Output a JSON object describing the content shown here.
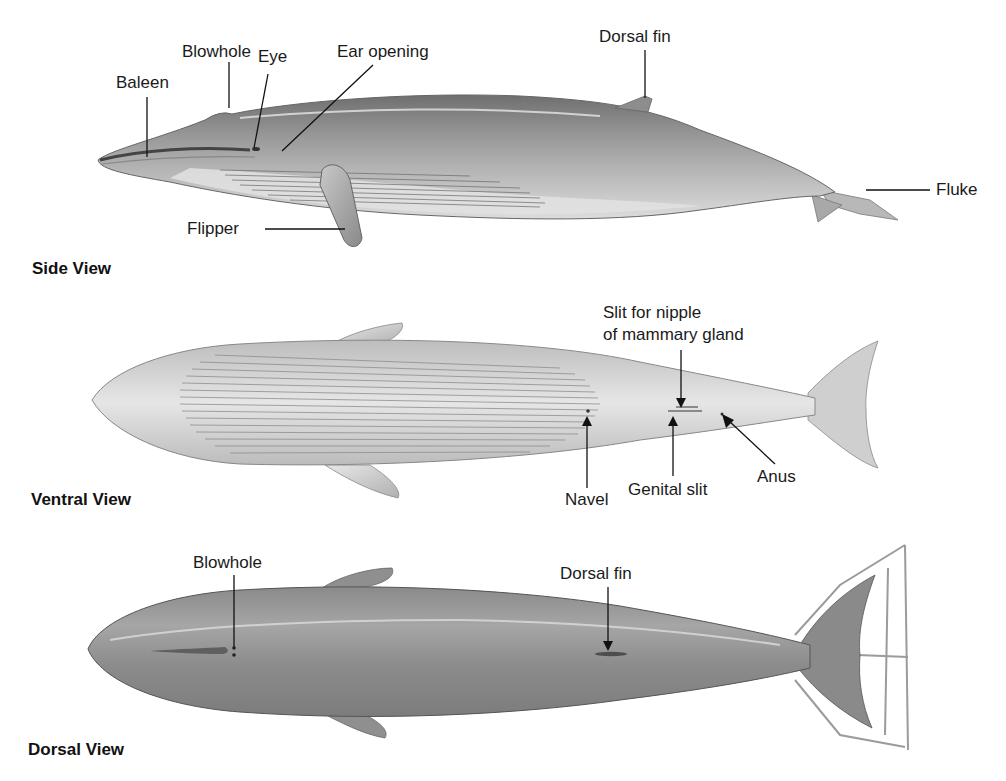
{
  "figure": {
    "views": [
      {
        "id": "side",
        "title": "Side View",
        "labels": {
          "baleen": "Baleen",
          "blowhole": "Blowhole",
          "eye": "Eye",
          "ear_opening": "Ear opening",
          "dorsal_fin": "Dorsal fin",
          "fluke": "Fluke",
          "flipper": "Flipper"
        }
      },
      {
        "id": "ventral",
        "title": "Ventral View",
        "labels": {
          "nipple_slit_line1": "Slit for nipple",
          "nipple_slit_line2": "of mammary gland",
          "navel": "Navel",
          "genital_slit": "Genital slit",
          "anus": "Anus"
        }
      },
      {
        "id": "dorsal",
        "title": "Dorsal View",
        "labels": {
          "blowhole": "Blowhole",
          "dorsal_fin": "Dorsal fin"
        }
      }
    ],
    "colors": {
      "body_dark": "#7a7a7a",
      "body_mid": "#9c9c9c",
      "body_light": "#d6d6d6",
      "belly": "#e4e4e4",
      "leader_line": "#111111"
    }
  }
}
